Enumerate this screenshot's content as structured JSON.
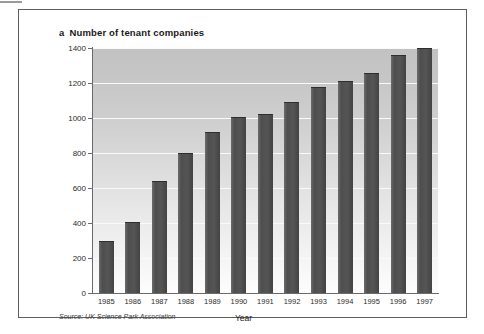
{
  "figure": {
    "panel_letter": "a",
    "title": "Number of tenant companies",
    "source_prefix": "Source:",
    "source": "UK Science Park Association",
    "bar_color": "#4e4e4e",
    "frame_color": "#5e5e5e",
    "axis_color": "#6a6a6a",
    "gridline_color": "#fafafa"
  },
  "chart_data": {
    "type": "bar",
    "title": "Number of tenant companies",
    "xlabel": "Year",
    "ylabel": "",
    "ylim": [
      0,
      1400
    ],
    "yticks": [
      0,
      200,
      400,
      600,
      800,
      1000,
      1200,
      1400
    ],
    "ytick_labels": [
      "0",
      "200",
      "400",
      "600",
      "800",
      "1000",
      "1200",
      "1400"
    ],
    "grid": true,
    "legend": "none",
    "categories": [
      "1985",
      "1986",
      "1987",
      "1988",
      "1989",
      "1990",
      "1991",
      "1992",
      "1993",
      "1994",
      "1995",
      "1996",
      "1997"
    ],
    "values": [
      300,
      405,
      640,
      800,
      920,
      1005,
      1025,
      1090,
      1175,
      1210,
      1260,
      1360,
      1400
    ],
    "source_note": "Source: UK Science Park Association"
  }
}
